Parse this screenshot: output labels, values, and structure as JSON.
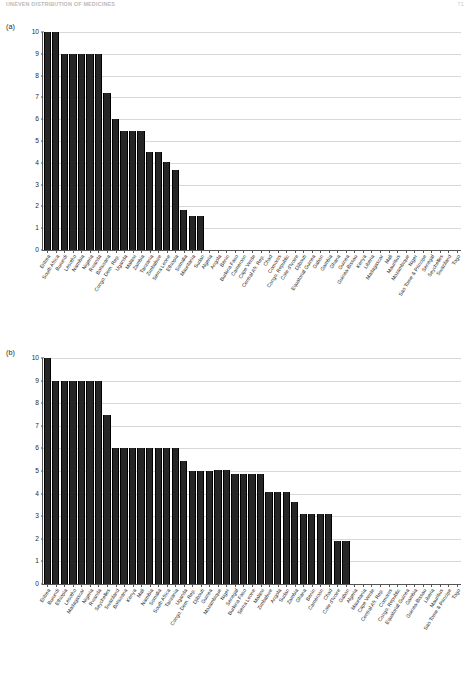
{
  "header": {
    "title": "Uneven Distribution of Medicines",
    "page_number": "71"
  },
  "chart_data": [
    {
      "id": "a",
      "panel_label": "(a)",
      "type": "bar",
      "title": "",
      "xlabel": "",
      "ylabel": "",
      "ylim": [
        0,
        10
      ],
      "yticks": [
        0,
        1,
        2,
        3,
        4,
        5,
        6,
        7,
        8,
        9,
        10
      ],
      "grid": true,
      "categories": [
        "Eritrea",
        "South Africa",
        "Burundi",
        "Lesotho",
        "Namibia",
        "Nigeria",
        "Rwanda",
        "Botswana",
        "Congo, Dem. Rep.",
        "Uganda",
        "Malawi",
        "Zambia",
        "Tanzania",
        "Zimbabwe",
        "Sierra Leone",
        "Ethiopia",
        "Somalia",
        "Mauritania",
        "Sudan",
        "Algeria",
        "Angola",
        "Benin",
        "Burkina Faso",
        "Cameroon",
        "Cape Verde",
        "Central Afr. Rep.",
        "Chad",
        "Comoros",
        "Congo, Republic",
        "Cote d'Ivoire",
        "Djibouti",
        "Equatorial Guinea",
        "Gabon",
        "Gambia",
        "Ghana",
        "Guinea",
        "Guinea-Bissau",
        "Kenya",
        "Liberia",
        "Madagascar",
        "Mali",
        "Mauritius",
        "Mozambique",
        "Niger",
        "Sao Tome & Principe",
        "Senegal",
        "Seychelles",
        "Swaziland",
        "Togo"
      ],
      "values": [
        10,
        10,
        9,
        9,
        9,
        9,
        9,
        7.2,
        6,
        5.45,
        5.45,
        5.45,
        4.5,
        4.5,
        4.05,
        3.65,
        1.85,
        1.55,
        1.55,
        0,
        0,
        0,
        0,
        0,
        0,
        0,
        0,
        0,
        0,
        0,
        0,
        0,
        0,
        0,
        0,
        0,
        0,
        0,
        0,
        0,
        0,
        0,
        0,
        0,
        0,
        0,
        0,
        0,
        0
      ]
    },
    {
      "id": "b",
      "panel_label": "(b)",
      "type": "bar",
      "title": "",
      "xlabel": "",
      "ylabel": "",
      "ylim": [
        0,
        10
      ],
      "yticks": [
        0,
        1,
        2,
        3,
        4,
        5,
        6,
        7,
        8,
        9,
        10
      ],
      "grid": true,
      "categories": [
        "Eritrea",
        "Burundi",
        "Ethiopia",
        "Lesotho",
        "Madagascar",
        "Nigeria",
        "Rwanda",
        "Seychelles",
        "Swaziland",
        "Botswana",
        "Kenya",
        "Mali",
        "Namibia",
        "Somalia",
        "South Africa",
        "Tanzania",
        "Uganda",
        "Congo, Dem. Rep.",
        "Djibouti",
        "Guinea",
        "Mozambique",
        "Niger",
        "Senegal",
        "Burkina Faso",
        "Sierra Leone",
        "Malawi",
        "Zimbabwe",
        "Angola",
        "Sudan",
        "Zambia",
        "Ghana",
        "Benin",
        "Cameroon",
        "Chad",
        "Cote d'Ivoire",
        "Gabon",
        "Algeria",
        "Mauritania",
        "Cape Verde",
        "Central Afr. Rep.",
        "Comoros",
        "Congo, Republic",
        "Equatorial Guinea",
        "Gambia",
        "Guinea-Bissau",
        "Liberia",
        "Mauritius",
        "Sao Tome & Principe",
        "Togo"
      ],
      "values": [
        10,
        9,
        9,
        9,
        9,
        9,
        9,
        7.5,
        6,
        6,
        6,
        6,
        6,
        6,
        6,
        6,
        5.45,
        5.0,
        5.0,
        5.0,
        5.05,
        5.05,
        4.85,
        4.85,
        4.85,
        4.85,
        4.05,
        4.05,
        4.05,
        3.65,
        3.1,
        3.1,
        3.1,
        3.1,
        1.9,
        1.9,
        0,
        0,
        0,
        0,
        0,
        0,
        0,
        0,
        0,
        0,
        0,
        0,
        0
      ]
    }
  ]
}
